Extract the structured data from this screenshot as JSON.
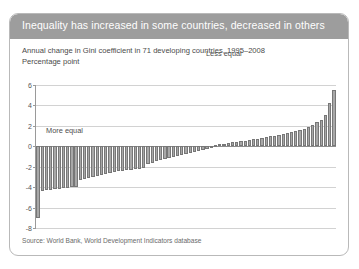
{
  "card": {
    "header_title": "Inequality has increased in some countries, decreased in others",
    "subtitle_line1": "Annual change in Gini coefficient in 71 developing countries, 1995–2008",
    "subtitle_line2": "Percentage point",
    "source": "Source: World Bank, World Development Indicators database"
  },
  "colors": {
    "header_bg": "#9d9d9d",
    "header_text": "#ffffff",
    "bar_fill": "#a8a8a8",
    "bar_stroke": "#777777",
    "gridline": "#d2d2d2",
    "axis": "#9a9a9a",
    "card_border": "#b9b9b9"
  },
  "chart_data": {
    "type": "bar",
    "title": "Inequality has increased in some countries, decreased in others",
    "subtitle": "Annual change in Gini coefficient in 71 developing countries, 1995–2008",
    "xlabel": "",
    "ylabel": "Percentage point",
    "ylim": [
      -8,
      6
    ],
    "yticks": [
      6,
      4,
      2,
      0,
      -2,
      -4,
      -6,
      -8
    ],
    "ytick_labels": [
      "6",
      "4",
      "2",
      "0",
      "-2",
      "-4",
      "-6",
      "-8"
    ],
    "grid": true,
    "legend": "none",
    "n_bars": 71,
    "annotations": [
      {
        "text": "Less equal",
        "x_index": 52,
        "y": 3.0
      },
      {
        "text": "More equal",
        "x_index": 9,
        "y": -4.9
      }
    ],
    "categories": [
      "1",
      "2",
      "3",
      "4",
      "5",
      "6",
      "7",
      "8",
      "9",
      "10",
      "11",
      "12",
      "13",
      "14",
      "15",
      "16",
      "17",
      "18",
      "19",
      "20",
      "21",
      "22",
      "23",
      "24",
      "25",
      "26",
      "27",
      "28",
      "29",
      "30",
      "31",
      "32",
      "33",
      "34",
      "35",
      "36",
      "37",
      "38",
      "39",
      "40",
      "41",
      "42",
      "43",
      "44",
      "45",
      "46",
      "47",
      "48",
      "49",
      "50",
      "51",
      "52",
      "53",
      "54",
      "55",
      "56",
      "57",
      "58",
      "59",
      "60",
      "61",
      "62",
      "63",
      "64",
      "65",
      "66",
      "67",
      "68",
      "69",
      "70",
      "71"
    ],
    "values": [
      -7.05,
      -4.35,
      -4.3,
      -4.25,
      -4.2,
      -4.15,
      -4.1,
      -4.05,
      -4.0,
      -3.95,
      -3.35,
      -3.25,
      -3.15,
      -3.05,
      -2.95,
      -2.85,
      -2.75,
      -2.65,
      -2.55,
      -2.45,
      -2.4,
      -2.35,
      -2.3,
      -2.25,
      -2.2,
      -2.15,
      -1.7,
      -1.6,
      -1.45,
      -1.35,
      -1.25,
      -1.15,
      -1.05,
      -0.95,
      -0.85,
      -0.75,
      -0.65,
      -0.55,
      -0.45,
      -0.35,
      -0.25,
      -0.15,
      0.1,
      0.18,
      0.25,
      0.32,
      0.38,
      0.45,
      0.5,
      0.55,
      0.62,
      0.68,
      0.75,
      0.82,
      0.9,
      0.98,
      1.05,
      1.12,
      1.2,
      1.28,
      1.35,
      1.45,
      1.55,
      1.7,
      1.85,
      2.05,
      2.35,
      2.6,
      3.1,
      4.2,
      5.55
    ]
  }
}
